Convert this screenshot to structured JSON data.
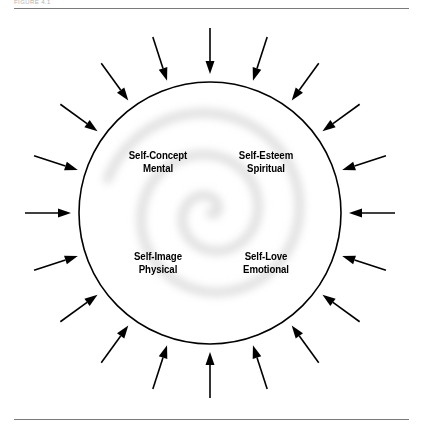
{
  "figure": {
    "caption": "FIGURE 4.1",
    "background_color": "#ffffff",
    "line_color": "#000000",
    "rule_color": "#7a7a7a",
    "spiral_color": "#d6d6d6"
  },
  "circle": {
    "center_x": 210,
    "center_y": 213,
    "radius": 131,
    "stroke_width": 1.6
  },
  "spiral": {
    "name": "inner-spiral",
    "turns": 2.6,
    "max_radius": 108,
    "stroke_color": "#d8d8d8",
    "blur": 4
  },
  "arrows": {
    "count": 20,
    "direction": "inward",
    "angle_step_degrees": 18,
    "tail_radius": 185,
    "head_radius": 139,
    "color": "#000000",
    "shaft_width": 1.6,
    "head_length": 13,
    "head_width": 9
  },
  "quadrants": [
    {
      "id": "self-concept",
      "primary": "Self-Concept",
      "secondary": "Mental",
      "position": "top-left"
    },
    {
      "id": "self-esteem",
      "primary": "Self-Esteem",
      "secondary": "Spiritual",
      "position": "top-right"
    },
    {
      "id": "self-image",
      "primary": "Self-Image",
      "secondary": "Physical",
      "position": "bottom-left"
    },
    {
      "id": "self-love",
      "primary": "Self-Love",
      "secondary": "Emotional",
      "position": "bottom-right"
    }
  ]
}
